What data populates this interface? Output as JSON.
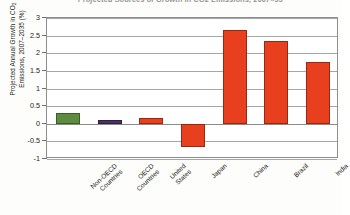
{
  "chart_data": {
    "type": "bar",
    "title": "Projected Sources of Growth in CO2 Emissions, 2007–35",
    "xlabel": "",
    "ylabel": "Projected Annual Growth in CO2 Emissions, 2007–2035 (%)",
    "ylabel_parts": {
      "line1_pre": "Projected Annual Growth in CO",
      "line1_sub": "2",
      "line2": "Emissions, 2007–2035 (%)"
    },
    "categories": [
      "Non-OECD Countries",
      "OECD Countries",
      "United States",
      "Japan",
      "China",
      "Brazil",
      "India"
    ],
    "values": [
      0.3,
      0.1,
      0.15,
      -0.65,
      2.65,
      2.35,
      1.75
    ],
    "bar_colors": [
      "#5e8c3e",
      "#4a3161",
      "#e8401f",
      "#e8401f",
      "#e8401f",
      "#e8401f",
      "#e8401f"
    ],
    "ylim": [
      -1,
      3
    ],
    "ytick_labels": [
      "3",
      "2.5",
      "2",
      "1.5",
      "1",
      "0.5",
      "0",
      "-0.5",
      "-1"
    ],
    "ytick_values": [
      3,
      2.5,
      2,
      1.5,
      1,
      0.5,
      0,
      -0.5,
      -1
    ],
    "grid": true,
    "legend": "none",
    "axis_color": "#8e8e8e",
    "grid_color": "#a6a6a6"
  }
}
